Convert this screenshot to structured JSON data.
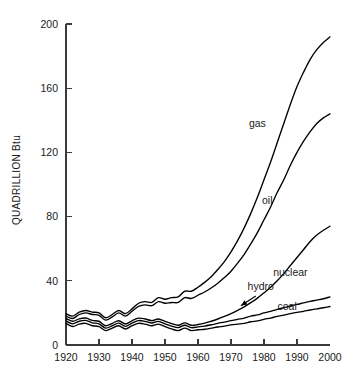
{
  "chart_data": {
    "type": "line",
    "title": "",
    "xlabel": "",
    "ylabel": "QUADRILLION Btu",
    "ylabel_main": "QUADRILLION",
    "ylabel_unit": "Btu",
    "xlim": [
      1920,
      2000
    ],
    "ylim": [
      0,
      200
    ],
    "grid": false,
    "legend": "inline-labels",
    "xticks": [
      1920,
      1930,
      1940,
      1950,
      1960,
      1970,
      1980,
      1990,
      2000
    ],
    "xtick_labels": [
      "1920",
      "1930",
      "1940",
      "1950",
      "1960",
      "1970",
      "1980",
      "1990",
      "2000"
    ],
    "yticks": [
      0,
      40,
      80,
      120,
      160,
      200
    ],
    "ytick_labels": [
      "0",
      "40",
      "80",
      "120",
      "160",
      "200"
    ],
    "note": "Cumulative stacked-style projection curves of U.S. energy consumption by source; upper curves are running totals.",
    "x": [
      1920,
      1922,
      1924,
      1926,
      1928,
      1930,
      1932,
      1934,
      1936,
      1938,
      1940,
      1942,
      1944,
      1946,
      1948,
      1950,
      1952,
      1954,
      1956,
      1958,
      1960,
      1962,
      1964,
      1966,
      1968,
      1970,
      1972,
      1974,
      1976,
      1978,
      1980,
      1982,
      1984,
      1986,
      1988,
      1990,
      1992,
      1994,
      1996,
      1998,
      2000
    ],
    "series": [
      {
        "name": "coal",
        "label": "coal",
        "label_x": 1987,
        "label_y": 22,
        "values": [
          13.5,
          11.5,
          13.0,
          13.5,
          12.0,
          11.5,
          9.0,
          10.5,
          12.0,
          10.0,
          12.0,
          13.5,
          13.0,
          12.0,
          13.0,
          11.5,
          10.0,
          9.0,
          10.5,
          9.0,
          9.5,
          9.8,
          10.5,
          11.2,
          11.8,
          12.5,
          13.0,
          13.5,
          14.5,
          15.0,
          16.0,
          16.8,
          17.8,
          18.6,
          19.5,
          20.3,
          21.0,
          21.8,
          22.5,
          23.2,
          24.0
        ]
      },
      {
        "name": "hydro",
        "label": "hydro",
        "label_x": 1979,
        "label_y": 34,
        "values": [
          15.0,
          13.2,
          14.8,
          15.3,
          13.8,
          13.2,
          10.5,
          12.0,
          13.6,
          11.6,
          13.6,
          15.2,
          14.7,
          13.7,
          14.7,
          13.2,
          11.8,
          10.8,
          12.3,
          10.8,
          11.3,
          11.8,
          12.6,
          13.5,
          14.3,
          15.2,
          16.0,
          16.8,
          18.0,
          18.8,
          20.0,
          21.0,
          22.2,
          23.2,
          24.3,
          25.3,
          26.2,
          27.2,
          28.0,
          28.8,
          30.0
        ]
      },
      {
        "name": "nuclear",
        "label": "nuclear",
        "label_x": 1988,
        "label_y": 43,
        "values": [
          16.5,
          14.8,
          16.3,
          16.8,
          15.3,
          14.8,
          12.0,
          13.5,
          15.1,
          13.1,
          15.1,
          16.7,
          16.2,
          15.2,
          16.2,
          14.7,
          13.3,
          12.3,
          13.8,
          12.3,
          12.8,
          13.6,
          14.8,
          16.2,
          17.8,
          19.6,
          21.6,
          23.8,
          26.4,
          29.2,
          32.5,
          36.0,
          40.0,
          44.5,
          49.5,
          54.5,
          59.5,
          64.5,
          68.5,
          71.5,
          74.0
        ]
      },
      {
        "name": "oil",
        "label": "oil",
        "label_x": 1981,
        "label_y": 88,
        "values": [
          18.0,
          16.5,
          19.0,
          20.0,
          19.0,
          18.5,
          15.5,
          17.5,
          20.0,
          18.0,
          21.0,
          24.0,
          25.0,
          24.5,
          27.0,
          26.0,
          26.5,
          26.5,
          29.5,
          29.0,
          31.0,
          33.0,
          35.5,
          38.5,
          42.0,
          46.0,
          51.0,
          56.5,
          63.0,
          70.0,
          78.0,
          86.0,
          95.0,
          103.0,
          112.0,
          120.0,
          127.0,
          133.0,
          138.0,
          141.5,
          144.0
        ]
      },
      {
        "name": "gas",
        "label": "gas",
        "label_x": 1978,
        "label_y": 136,
        "values": [
          19.5,
          18.0,
          20.5,
          21.5,
          20.5,
          20.0,
          17.0,
          19.0,
          21.5,
          19.5,
          22.5,
          26.0,
          27.0,
          26.5,
          29.5,
          28.5,
          29.5,
          30.0,
          33.5,
          33.5,
          36.0,
          39.0,
          42.5,
          47.0,
          52.0,
          58.0,
          65.0,
          73.0,
          82.0,
          92.0,
          103.0,
          114.0,
          126.0,
          138.0,
          150.0,
          161.0,
          170.0,
          178.0,
          184.0,
          188.5,
          192.0
        ]
      }
    ],
    "annotations": [
      {
        "name": "hydro-pointer",
        "text": "hydro",
        "from_x": 1977.5,
        "from_y": 30.5,
        "to_x": 1973.0,
        "to_y": 24.5
      }
    ]
  }
}
